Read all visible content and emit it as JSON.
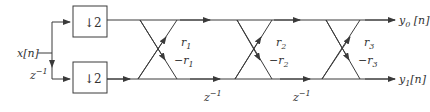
{
  "diagram": {
    "input": {
      "label": "x[n]"
    },
    "delay_input": {
      "label": "z⁻¹",
      "base": "z",
      "exp": "−1"
    },
    "downsamplers": [
      {
        "label": "↓2",
        "arrow": "↓",
        "factor": "2"
      },
      {
        "label": "↓2",
        "arrow": "↓",
        "factor": "2"
      }
    ],
    "stages": [
      {
        "upper_coef": "r₁",
        "lower_coef": "−r₁",
        "r_base": "r",
        "index": "1"
      },
      {
        "upper_coef": "r₂",
        "lower_coef": "−r₂",
        "r_base": "r",
        "index": "2"
      },
      {
        "upper_coef": "r₃",
        "lower_coef": "−r₃",
        "r_base": "r",
        "index": "3"
      }
    ],
    "delays": [
      {
        "label": "z⁻¹",
        "base": "z",
        "exp": "−1"
      },
      {
        "label": "z⁻¹",
        "base": "z",
        "exp": "−1"
      }
    ],
    "outputs": [
      {
        "label": "y₀[n]",
        "base": "y",
        "index": "0",
        "suffix": "[n]"
      },
      {
        "label": "y₁[n]",
        "base": "y",
        "index": "1",
        "suffix": "[n]"
      }
    ],
    "colors": {
      "line": "#3a3a3a",
      "text": "#333333",
      "background": "#ffffff"
    }
  }
}
